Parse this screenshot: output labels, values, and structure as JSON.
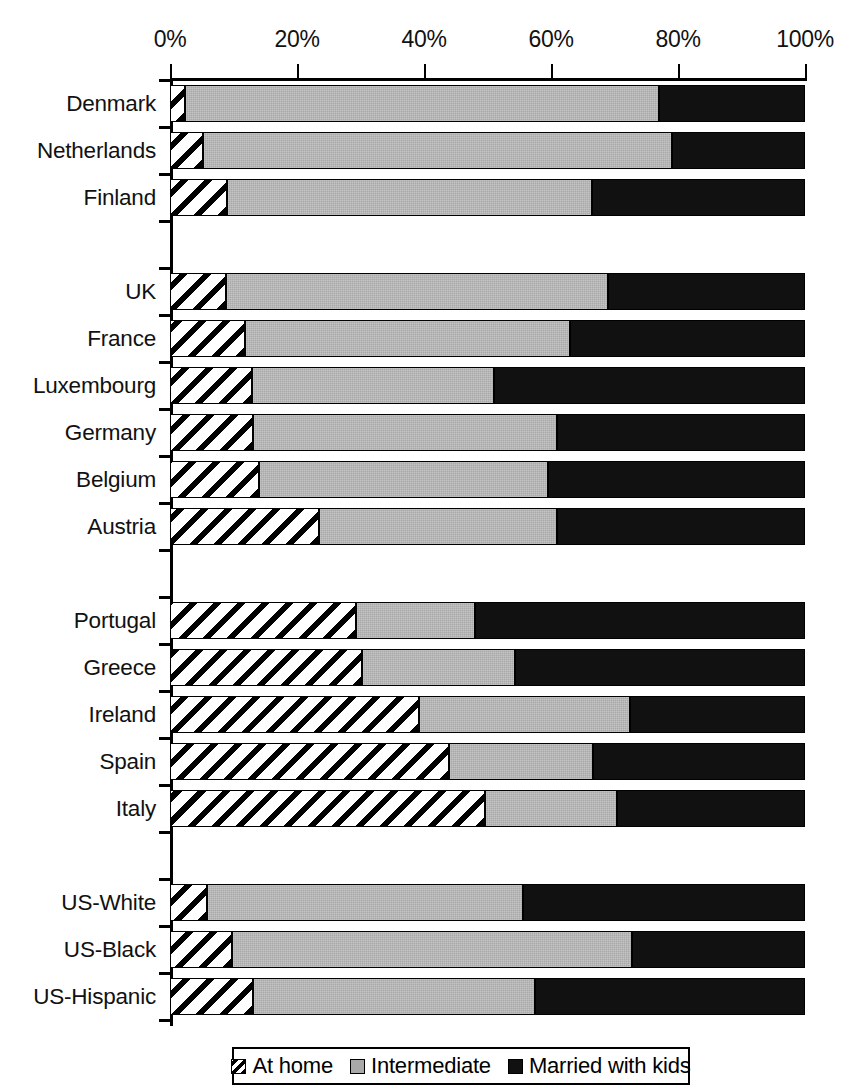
{
  "chart_data": {
    "type": "bar",
    "orientation": "horizontal",
    "stacked": true,
    "title": "",
    "xlabel": "",
    "ylabel": "",
    "xlim": [
      0,
      100
    ],
    "xticks": [
      "0%",
      "20%",
      "40%",
      "60%",
      "80%",
      "100%"
    ],
    "xtick_values": [
      0,
      20,
      40,
      60,
      80,
      100
    ],
    "grid": false,
    "legend_position": "bottom",
    "categories": [
      "Denmark",
      "Netherlands",
      "Finland",
      "UK",
      "France",
      "Luxembourg",
      "Germany",
      "Belgium",
      "Austria",
      "Portugal",
      "Greece",
      "Ireland",
      "Spain",
      "Italy",
      "US-White",
      "US-Black",
      "US-Hispanic"
    ],
    "group_breaks_after": [
      "Finland",
      "Austria",
      "Italy"
    ],
    "series": [
      {
        "name": "At home",
        "color": "#ffffff",
        "pattern": "diagonal-hatch",
        "values": [
          2.4,
          5.2,
          9.0,
          8.8,
          11.8,
          12.9,
          13.0,
          14.0,
          23.5,
          29.3,
          30.2,
          39.2,
          44.0,
          49.6,
          5.8,
          9.8,
          13.0
        ]
      },
      {
        "name": "Intermediate",
        "color": "#a9a9a9",
        "pattern": "solid-gray",
        "values": [
          74.6,
          73.8,
          57.5,
          60.2,
          51.2,
          38.1,
          48.0,
          45.5,
          37.5,
          18.7,
          24.1,
          33.2,
          22.6,
          20.8,
          49.8,
          62.9,
          44.5
        ]
      },
      {
        "name": "Married with kids",
        "color": "#111111",
        "pattern": "solid-black",
        "values": [
          23.0,
          21.0,
          33.5,
          31.0,
          37.0,
          49.0,
          39.0,
          40.5,
          39.0,
          52.0,
          45.7,
          27.6,
          33.4,
          29.6,
          44.4,
          27.3,
          42.5
        ]
      }
    ],
    "cumulative_ends": {
      "at_home": [
        2.4,
        5.2,
        9.0,
        8.8,
        11.8,
        12.9,
        13.0,
        14.0,
        23.5,
        29.3,
        30.2,
        39.2,
        44.0,
        49.6,
        5.8,
        9.8,
        13.0
      ],
      "intermediate": [
        77.0,
        79.0,
        66.5,
        69.0,
        63.0,
        51.0,
        61.0,
        59.5,
        61.0,
        48.0,
        54.3,
        72.4,
        66.6,
        70.4,
        55.6,
        72.7,
        57.5
      ],
      "married": [
        100,
        100,
        100,
        100,
        100,
        100,
        100,
        100,
        100,
        100,
        100,
        100,
        100,
        100,
        100,
        100,
        100
      ]
    }
  },
  "legend": {
    "items": [
      {
        "label": "At home",
        "swatch": "hatch-swatch-icon"
      },
      {
        "label": "Intermediate",
        "swatch": "gray-swatch-icon"
      },
      {
        "label": "Married with kids",
        "swatch": "black-swatch-icon"
      }
    ]
  }
}
